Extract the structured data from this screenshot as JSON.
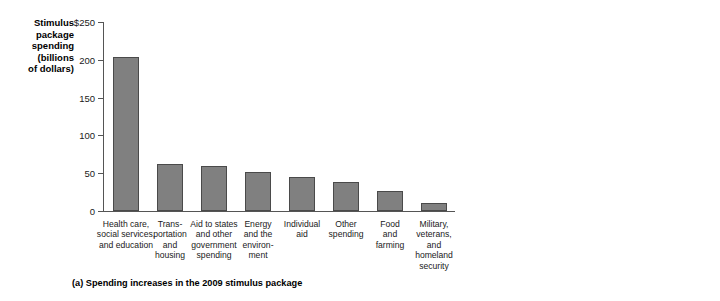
{
  "chart_data": [
    {
      "type": "bar",
      "panel": "a",
      "title": "",
      "caption": "(a) Spending increases in the 2009 stimulus package",
      "ylabel_lines": [
        "Stimulus",
        "package",
        "spending",
        "(billions",
        "of dollars)"
      ],
      "ylabel": "Stimulus package spending (billions of dollars)",
      "xlabel": "",
      "ylim": [
        0,
        250
      ],
      "yticks": [
        0,
        50,
        100,
        150,
        200,
        250
      ],
      "ytick_labels": [
        "0",
        "50",
        "100",
        "150",
        "200",
        "$250"
      ],
      "grid": false,
      "legend": "none",
      "bar_color": "#808080",
      "categories": [
        "Health care, social services, and education",
        "Transportation and housing",
        "Aid to states and other government spending",
        "Energy and the environment",
        "Individual aid",
        "Other spending",
        "Food and farming",
        "Military, veterans, and homeland security"
      ],
      "category_lines": [
        [
          "Health care,",
          "social services,",
          "and education"
        ],
        [
          "Trans-",
          "portation",
          "and",
          "housing"
        ],
        [
          "Aid to states",
          "and other",
          "government",
          "spending"
        ],
        [
          "Energy",
          "and the",
          "environ-",
          "ment"
        ],
        [
          "Individual",
          "aid"
        ],
        [
          "Other",
          "spending"
        ],
        [
          "Food",
          "and",
          "farming"
        ],
        [
          "Military,",
          "veterans,",
          "and",
          "homeland",
          "security"
        ]
      ],
      "values": [
        204,
        62,
        60,
        51,
        45,
        38,
        26,
        11
      ]
    },
    {
      "type": "bar",
      "panel": "b",
      "title": "",
      "caption": "(b) Tax cuts in the 2009 stimulus package",
      "ylabel_lines": [
        "Tax cuts",
        "(billions",
        "of dollars)"
      ],
      "ylabel": "Tax cuts (billions of dollars)",
      "xlabel": "",
      "ylim": [
        0,
        250
      ],
      "yticks": [
        0,
        50,
        100,
        150,
        200,
        250
      ],
      "ytick_labels": [
        "0",
        "50",
        "100",
        "150",
        "200",
        "$250"
      ],
      "grid": false,
      "legend": "none",
      "bar_color": "#808080",
      "categories": [
        "Individual",
        "Infrastructure",
        "Energy",
        "Business"
      ],
      "category_lines": [
        [
          "Individual"
        ],
        [
          "Infra-",
          "structure"
        ],
        [
          "Energy"
        ],
        [
          "Business"
        ]
      ],
      "values": [
        233,
        25,
        20,
        6
      ]
    }
  ]
}
